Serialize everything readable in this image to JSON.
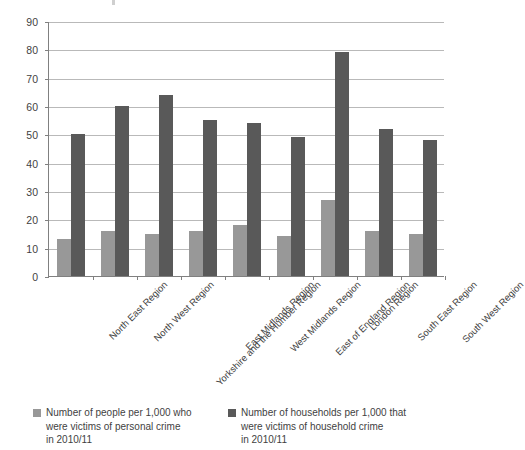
{
  "chart_data": {
    "type": "bar",
    "title": "",
    "xlabel": "",
    "ylabel": "",
    "ylim": [
      0,
      90
    ],
    "ytick_step": 10,
    "yticks": [
      0,
      10,
      20,
      30,
      40,
      50,
      60,
      70,
      80,
      90
    ],
    "grid": true,
    "legend_position": "bottom",
    "categories": [
      "North East Region",
      "North West Region",
      "Yorkshire and the Humber Region",
      "East Midlands Region",
      "West Midlands Region",
      "East of England Region",
      "London Region",
      "South East Region",
      "South West Region"
    ],
    "series": [
      {
        "name": "Number of people per 1,000 who were victims of personal crime in 2010/11",
        "color": "#989898",
        "values": [
          13,
          16,
          15,
          16,
          18,
          14,
          27,
          16,
          15
        ]
      },
      {
        "name": "Number of households per 1,000 that were victims of household crime in 2010/11",
        "color": "#595959",
        "values": [
          50,
          60,
          64,
          55,
          54,
          49,
          79,
          52,
          48
        ]
      }
    ]
  },
  "legend": {
    "entries": [
      {
        "swatch": "light",
        "line1": "Number of people per 1,000 who",
        "line2": "were victims of personal crime",
        "line3": "in 2010/11"
      },
      {
        "swatch": "dark",
        "line1": "Number of households per 1,000 that",
        "line2": "were victims of household crime",
        "line3": "in 2010/11"
      }
    ]
  }
}
